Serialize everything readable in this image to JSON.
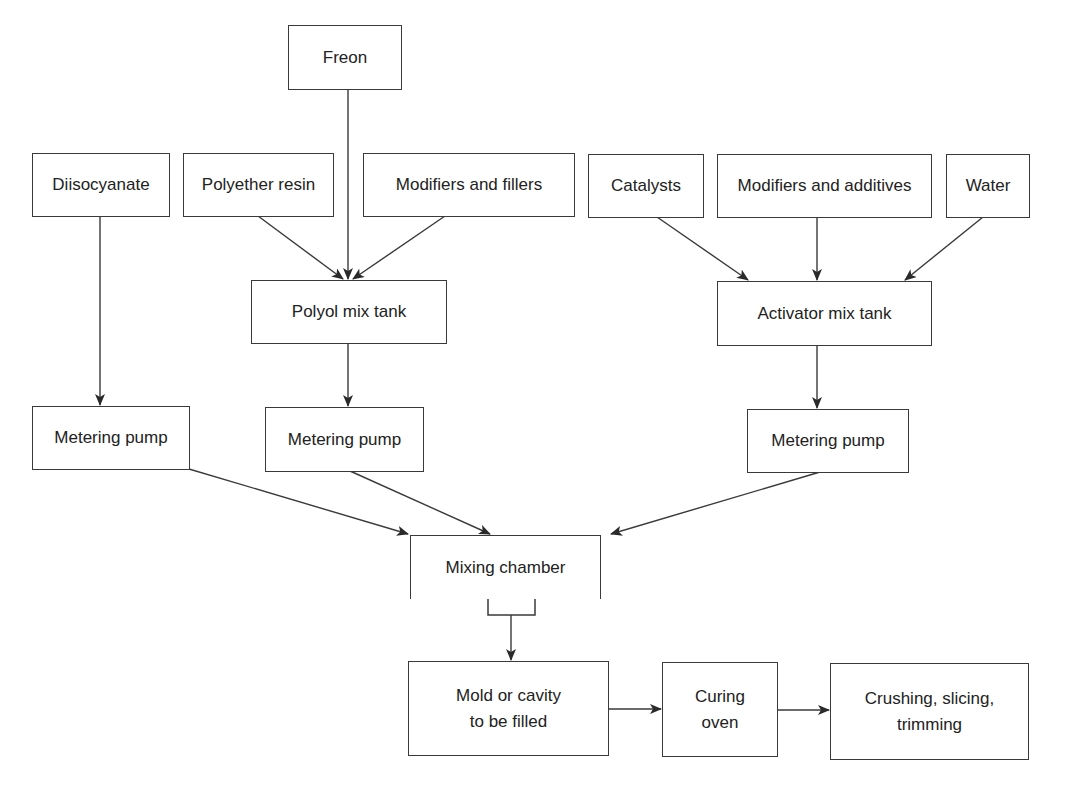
{
  "diagram": {
    "type": "process-flowchart",
    "stroke_color": "#3a3a3a",
    "text_color": "#222222",
    "nodes": {
      "freon": {
        "label": "Freon"
      },
      "diisocyanate": {
        "label": "Diisocyanate"
      },
      "polyether_resin": {
        "label": "Polyether resin"
      },
      "modifiers_fillers": {
        "label": "Modifiers and fillers"
      },
      "catalysts": {
        "label": "Catalysts"
      },
      "modifiers_additives": {
        "label": "Modifiers and additives"
      },
      "water": {
        "label": "Water"
      },
      "polyol_mix_tank": {
        "label": "Polyol mix tank"
      },
      "activator_mix_tank": {
        "label": "Activator mix tank"
      },
      "metering_pump_1": {
        "label": "Metering pump"
      },
      "metering_pump_2": {
        "label": "Metering pump"
      },
      "metering_pump_3": {
        "label": "Metering pump"
      },
      "mixing_chamber": {
        "label": "Mixing chamber"
      },
      "mold": {
        "label": "Mold or cavity\nto be filled"
      },
      "curing_oven": {
        "label": "Curing\noven"
      },
      "finishing": {
        "label": "Crushing, slicing,\ntrimming"
      }
    },
    "edges": [
      {
        "from": "freon",
        "to": "polyol_mix_tank"
      },
      {
        "from": "polyether_resin",
        "to": "polyol_mix_tank"
      },
      {
        "from": "modifiers_fillers",
        "to": "polyol_mix_tank"
      },
      {
        "from": "catalysts",
        "to": "activator_mix_tank"
      },
      {
        "from": "modifiers_additives",
        "to": "activator_mix_tank"
      },
      {
        "from": "water",
        "to": "activator_mix_tank"
      },
      {
        "from": "diisocyanate",
        "to": "metering_pump_1"
      },
      {
        "from": "polyol_mix_tank",
        "to": "metering_pump_2"
      },
      {
        "from": "activator_mix_tank",
        "to": "metering_pump_3"
      },
      {
        "from": "metering_pump_1",
        "to": "mixing_chamber"
      },
      {
        "from": "metering_pump_2",
        "to": "mixing_chamber"
      },
      {
        "from": "metering_pump_3",
        "to": "mixing_chamber"
      },
      {
        "from": "mixing_chamber",
        "to": "mold"
      },
      {
        "from": "mold",
        "to": "curing_oven"
      },
      {
        "from": "curing_oven",
        "to": "finishing"
      }
    ]
  }
}
